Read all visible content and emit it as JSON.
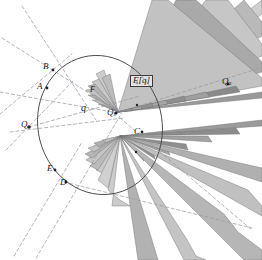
{
  "figure": {
    "background_color": "#ffffff",
    "curve_color": "#4a4a4a",
    "dash_color": "#9a9aa6",
    "spike_fill_light": "#c9c9c9",
    "spike_fill_mid": "#a8a8a8",
    "spike_fill_dark": "#7d7d7d",
    "spike_stroke": "#6b6b6b",
    "label_color": "#1a1a1a"
  },
  "labels": [
    {
      "id": "B",
      "text": "B",
      "sub": "",
      "x": 43,
      "y": 62,
      "boxed": false,
      "size": 9
    },
    {
      "id": "A",
      "text": "A",
      "sub": "",
      "x": 37,
      "y": 82,
      "boxed": false,
      "size": 9
    },
    {
      "id": "F",
      "text": "F",
      "sub": "",
      "x": 90,
      "y": 86,
      "boxed": false,
      "size": 8
    },
    {
      "id": "Fq",
      "text": "F[q]",
      "sub": "",
      "x": 130,
      "y": 75,
      "boxed": true,
      "size": 9
    },
    {
      "id": "q",
      "text": "q",
      "sub": "",
      "x": 81,
      "y": 103,
      "boxed": false,
      "size": 10
    },
    {
      "id": "Qs",
      "text": "Q",
      "sub": "s",
      "x": 107,
      "y": 108,
      "boxed": false,
      "size": 9
    },
    {
      "id": "Qa",
      "text": "Q",
      "sub": "a",
      "x": 222,
      "y": 77,
      "boxed": false,
      "size": 9
    },
    {
      "id": "Q",
      "text": "Q",
      "sub": "",
      "x": 21,
      "y": 120,
      "boxed": false,
      "size": 9
    },
    {
      "id": "C",
      "text": "C",
      "sub": "",
      "x": 134,
      "y": 127,
      "boxed": false,
      "size": 9
    },
    {
      "id": "E",
      "text": "E",
      "sub": "",
      "x": 47,
      "y": 164,
      "boxed": false,
      "size": 9
    },
    {
      "id": "D",
      "text": "D",
      "sub": "",
      "x": 60,
      "y": 178,
      "boxed": false,
      "size": 9
    }
  ],
  "points": [
    {
      "name": "B",
      "x": 53,
      "y": 70
    },
    {
      "name": "A",
      "x": 47,
      "y": 88
    },
    {
      "name": "Qs",
      "x": 116,
      "y": 113
    },
    {
      "name": "Qa",
      "x": 228,
      "y": 84
    },
    {
      "name": "Q",
      "x": 29,
      "y": 127
    },
    {
      "name": "C",
      "x": 142,
      "y": 132
    },
    {
      "name": "E",
      "x": 55,
      "y": 170
    },
    {
      "name": "D",
      "x": 66,
      "y": 182
    },
    {
      "name": "Fq",
      "x": 137,
      "y": 83
    }
  ],
  "conic": {
    "cx": 100,
    "cy": 125,
    "rx": 62,
    "ry": 70,
    "rotation": -14
  },
  "fans": {
    "upper": {
      "apex_x": 118,
      "apex_y": 112,
      "count": 13
    },
    "lower": {
      "apex_x": 120,
      "apex_y": 136,
      "count": 13
    }
  },
  "dashed_lines": [
    {
      "x1": 2,
      "y1": 38,
      "x2": 120,
      "y2": 112
    },
    {
      "x1": 22,
      "y1": 8,
      "x2": 96,
      "y2": 118
    },
    {
      "x1": 0,
      "y1": 90,
      "x2": 116,
      "y2": 113
    },
    {
      "x1": 0,
      "y1": 112,
      "x2": 70,
      "y2": 56
    },
    {
      "x1": 6,
      "y1": 148,
      "x2": 70,
      "y2": 82
    },
    {
      "x1": 14,
      "y1": 254,
      "x2": 80,
      "y2": 140
    },
    {
      "x1": 36,
      "y1": 258,
      "x2": 118,
      "y2": 118
    },
    {
      "x1": 116,
      "y1": 113,
      "x2": 256,
      "y2": 70
    },
    {
      "x1": 118,
      "y1": 118,
      "x2": 250,
      "y2": 228
    },
    {
      "x1": 60,
      "y1": 182,
      "x2": 250,
      "y2": 226
    },
    {
      "x1": 12,
      "y1": 130,
      "x2": 122,
      "y2": 118
    }
  ]
}
